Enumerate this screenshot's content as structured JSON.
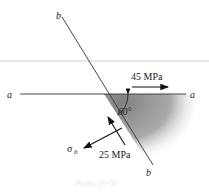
{
  "figure": {
    "labels": {
      "a_left": "a",
      "a_right": "a",
      "b_top": "b",
      "b_bottom": "b",
      "angle": "60°",
      "normal_stress": "45 MPa",
      "shear_stress": "25 MPa",
      "sigma_b": "σ",
      "sigma_b_sub": "b"
    },
    "caption": "Probs. 10-55"
  }
}
